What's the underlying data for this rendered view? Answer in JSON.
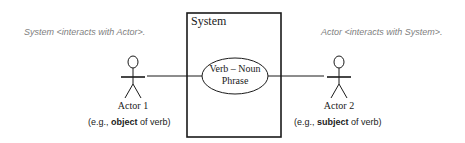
{
  "diagram": {
    "type": "UML use case diagram",
    "system": {
      "label": "System"
    },
    "use_case": {
      "line1": "Verb – Noun",
      "line2": "Phrase"
    },
    "actors": [
      {
        "label": "Actor 1",
        "note": "System <interacts with Actor>.",
        "caption_prefix": "(e.g., ",
        "caption_bold": "object",
        "caption_suffix": " of verb)"
      },
      {
        "label": "Actor 2",
        "note": "Actor <interacts with System>.",
        "caption_prefix": "(e.g., ",
        "caption_bold": "subject",
        "caption_suffix": " of verb)"
      }
    ],
    "colors": {
      "line": "#1a1a1a",
      "note_text": "#808080",
      "background": "#ffffff"
    }
  }
}
